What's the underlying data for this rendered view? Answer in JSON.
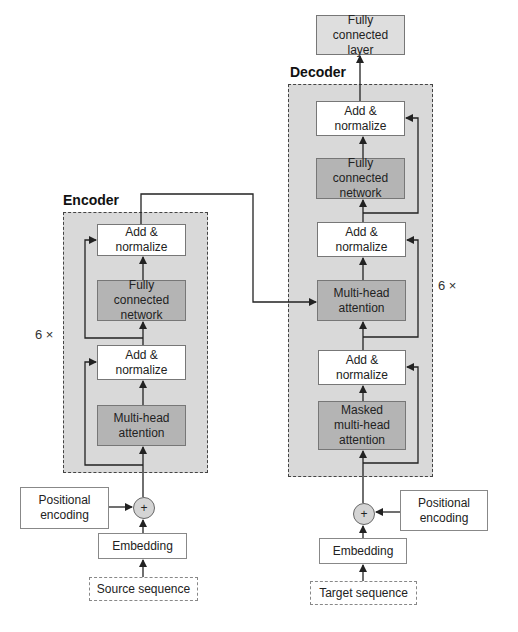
{
  "encoder": {
    "title": "Encoder",
    "repeat": "6 ×",
    "blocks": [
      {
        "label": "Add &\nnormalize",
        "style": "white"
      },
      {
        "label": "Fully connected\nnetwork",
        "style": "dark"
      },
      {
        "label": "Add &\nnormalize",
        "style": "white"
      },
      {
        "label": "Multi-head\nattention",
        "style": "dark"
      }
    ],
    "positional_encoding": "Positional\nencoding",
    "sum_symbol": "+",
    "embedding": "Embedding",
    "input": "Source sequence"
  },
  "decoder": {
    "title": "Decoder",
    "repeat": "6 ×",
    "output_layer": "Fully connected\nlayer",
    "blocks": [
      {
        "label": "Add &\nnormalize",
        "style": "white"
      },
      {
        "label": "Fully connected\nnetwork",
        "style": "dark"
      },
      {
        "label": "Add &\nnormalize",
        "style": "white"
      },
      {
        "label": "Multi-head\nattention",
        "style": "dark"
      },
      {
        "label": "Add &\nnormalize",
        "style": "white"
      },
      {
        "label": "Masked\nmulti-head\nattention",
        "style": "dark"
      }
    ],
    "positional_encoding": "Positional\nencoding",
    "sum_symbol": "+",
    "embedding": "Embedding",
    "input": "Target sequence"
  },
  "colors": {
    "stack_bg": "#d9d9d9",
    "dark_block": "#b4b4b4",
    "white_block": "#ffffff",
    "line": "#222222"
  }
}
